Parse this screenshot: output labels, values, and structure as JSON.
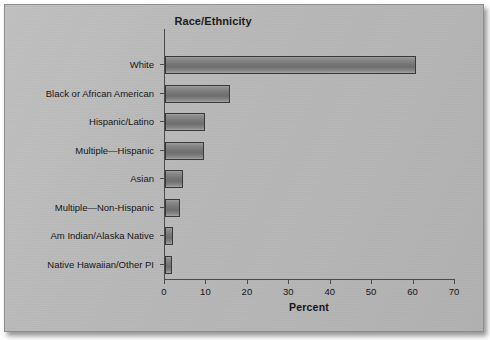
{
  "chart_data": {
    "type": "bar",
    "orientation": "horizontal",
    "title": "Race/Ethnicity",
    "xlabel": "Percent",
    "ylabel": "",
    "xlim": [
      0,
      70
    ],
    "xticks": [
      0,
      10,
      20,
      30,
      40,
      50,
      60,
      70
    ],
    "grid": false,
    "legend": null,
    "categories": [
      "White",
      "Black or African American",
      "Hispanic/Latino",
      "Multiple—Hispanic",
      "Asian",
      "Multiple—Non-Hispanic",
      "Am Indian/Alaska Native",
      "Native Hawaiian/Other PI"
    ],
    "values": [
      60.6,
      15.7,
      9.7,
      9.4,
      4.3,
      3.6,
      1.9,
      1.8
    ],
    "bar_fill_color": "#7c7c7c",
    "bar_edge_color": "#3a3a3a",
    "background_color": "#b9b9b9",
    "axis_color": "#4a4a4a"
  }
}
